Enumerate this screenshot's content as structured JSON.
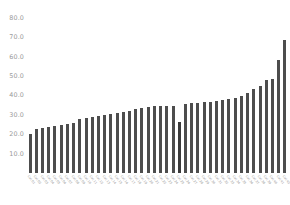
{
  "chart_data": {
    "type": "bar",
    "title": "",
    "xlabel": "",
    "ylabel": "",
    "ylim": [
      0,
      85
    ],
    "grid": false,
    "legend": null,
    "bar_color": "#4d4d4d",
    "axis_text_color": "#9a9a9a",
    "background": "#ffffff",
    "ytick_labels": [
      "80.0",
      "70.0",
      "60.0",
      "50.0",
      "40.0",
      "30.0",
      "20.0",
      "10.0"
    ],
    "ytick_values": [
      80,
      70,
      60,
      50,
      40,
      30,
      20,
      10
    ],
    "categories": [
      "Cat 01",
      "Cat 02",
      "Cat 03",
      "Cat 04",
      "Cat 05",
      "Cat 06",
      "Cat 07",
      "Cat 08",
      "Cat 09",
      "Cat 10",
      "Cat 11",
      "Cat 12",
      "Cat 13",
      "Cat 14",
      "Cat 15",
      "Cat 16",
      "Cat 17",
      "Cat 18",
      "Cat 19",
      "Cat 20",
      "Cat 21",
      "Cat 22",
      "Cat 23",
      "Cat 24",
      "Cat 25",
      "Cat 26",
      "Cat 27",
      "Cat 28",
      "Cat 29",
      "Cat 30",
      "Cat 31",
      "Cat 32",
      "Cat 33",
      "Cat 34",
      "Cat 35",
      "Cat 36",
      "Cat 37",
      "Cat 38",
      "Cat 39",
      "Cat 40",
      "Cat 41",
      "Cat 42"
    ],
    "values": [
      20.0,
      22.5,
      23.0,
      23.5,
      24.0,
      24.5,
      25.0,
      26.0,
      28.0,
      28.5,
      29.0,
      29.5,
      30.0,
      30.5,
      31.0,
      31.5,
      32.0,
      33.0,
      33.5,
      34.0,
      34.5,
      34.5,
      34.5,
      34.5,
      26.5,
      35.5,
      36.0,
      36.0,
      36.5,
      36.5,
      37.0,
      37.5,
      38.0,
      38.5,
      39.5,
      41.0,
      43.5,
      45.0,
      48.0,
      48.5,
      58.0,
      68.5
    ],
    "highlight_index": 24
  }
}
